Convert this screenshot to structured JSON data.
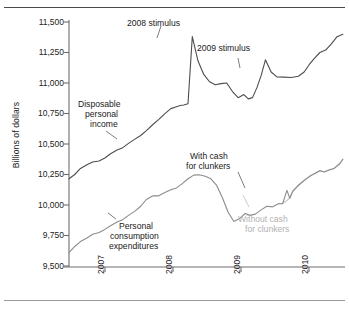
{
  "figure": {
    "name": "disposable-income-vs-consumption-chart",
    "background": "#ffffff"
  },
  "axes": {
    "ylabel": "Billions of dollars",
    "yticks": [
      "11,500",
      "11,250",
      "11,000",
      "10,750",
      "10,500",
      "10,250",
      "10,000",
      "9,750",
      "9,500"
    ],
    "xticks": [
      "2007",
      "2008",
      "2009",
      "2010"
    ]
  },
  "annotations": {
    "stimulus_2008": "2008 stimulus",
    "stimulus_2009": "2009 stimulus",
    "disposable_income_l1": "Disposable",
    "disposable_income_l2": "personal",
    "disposable_income_l3": "income",
    "pce_l1": "Personal",
    "pce_l2": "consumption",
    "pce_l3": "expenditures",
    "with_clunkers_l1": "With cash",
    "with_clunkers_l2": "for clunkers",
    "without_clunkers_l1": "Without cash",
    "without_clunkers_l2": "for clunkers"
  },
  "colors": {
    "income_line": "#4d4d4d",
    "pce_line": "#8c8c8c",
    "without_clunkers_line": "#c4c4c4",
    "axis": "#6e6e6e",
    "text": "#232323",
    "gray_text": "#b2b2b2"
  },
  "chart_data": {
    "type": "line",
    "title": "",
    "xlabel": "",
    "ylabel": "Billions of dollars",
    "ylim": [
      9500,
      11500
    ],
    "xlim": [
      2006.5,
      2010.35
    ],
    "grid": false,
    "legend": "annotations-inline",
    "yticks": [
      9500,
      9750,
      10000,
      10250,
      10500,
      10750,
      11000,
      11250,
      11500
    ],
    "xticks": [
      2007,
      2008,
      2009,
      2010
    ],
    "series": [
      {
        "name": "Disposable personal income",
        "color": "#4d4d4d",
        "points": [
          [
            2006.5,
            10215
          ],
          [
            2006.58,
            10250
          ],
          [
            2006.66,
            10300
          ],
          [
            2006.75,
            10330
          ],
          [
            2006.83,
            10352
          ],
          [
            2006.92,
            10360
          ],
          [
            2007.0,
            10385
          ],
          [
            2007.08,
            10420
          ],
          [
            2007.17,
            10450
          ],
          [
            2007.25,
            10470
          ],
          [
            2007.33,
            10505
          ],
          [
            2007.42,
            10540
          ],
          [
            2007.5,
            10570
          ],
          [
            2007.58,
            10610
          ],
          [
            2007.67,
            10660
          ],
          [
            2007.75,
            10700
          ],
          [
            2007.83,
            10745
          ],
          [
            2007.92,
            10790
          ],
          [
            2008.0,
            10805
          ],
          [
            2008.05,
            10815
          ],
          [
            2008.1,
            10820
          ],
          [
            2008.16,
            10830
          ],
          [
            2008.22,
            11380
          ],
          [
            2008.3,
            11180
          ],
          [
            2008.38,
            11070
          ],
          [
            2008.46,
            11010
          ],
          [
            2008.54,
            10985
          ],
          [
            2008.62,
            10995
          ],
          [
            2008.7,
            11000
          ],
          [
            2008.78,
            10930
          ],
          [
            2008.86,
            10880
          ],
          [
            2008.94,
            10905
          ],
          [
            2009.0,
            10870
          ],
          [
            2009.06,
            10880
          ],
          [
            2009.12,
            10960
          ],
          [
            2009.18,
            11060
          ],
          [
            2009.24,
            11190
          ],
          [
            2009.32,
            11090
          ],
          [
            2009.4,
            11050
          ],
          [
            2009.5,
            11048
          ],
          [
            2009.6,
            11045
          ],
          [
            2009.7,
            11055
          ],
          [
            2009.78,
            11090
          ],
          [
            2009.85,
            11150
          ],
          [
            2009.92,
            11200
          ],
          [
            2010.0,
            11250
          ],
          [
            2010.08,
            11270
          ],
          [
            2010.16,
            11320
          ],
          [
            2010.24,
            11380
          ],
          [
            2010.32,
            11400
          ]
        ]
      },
      {
        "name": "Personal consumption expenditures (with cash for clunkers)",
        "color": "#8c8c8c",
        "points": [
          [
            2006.5,
            9610
          ],
          [
            2006.58,
            9660
          ],
          [
            2006.66,
            9700
          ],
          [
            2006.75,
            9730
          ],
          [
            2006.83,
            9760
          ],
          [
            2006.92,
            9775
          ],
          [
            2007.0,
            9800
          ],
          [
            2007.08,
            9830
          ],
          [
            2007.17,
            9860
          ],
          [
            2007.25,
            9880
          ],
          [
            2007.33,
            9915
          ],
          [
            2007.42,
            9950
          ],
          [
            2007.5,
            9990
          ],
          [
            2007.58,
            10045
          ],
          [
            2007.67,
            10075
          ],
          [
            2007.75,
            10075
          ],
          [
            2007.83,
            10100
          ],
          [
            2007.92,
            10125
          ],
          [
            2008.0,
            10140
          ],
          [
            2008.08,
            10175
          ],
          [
            2008.16,
            10215
          ],
          [
            2008.24,
            10245
          ],
          [
            2008.32,
            10248
          ],
          [
            2008.4,
            10235
          ],
          [
            2008.48,
            10215
          ],
          [
            2008.56,
            10160
          ],
          [
            2008.64,
            10060
          ],
          [
            2008.72,
            9940
          ],
          [
            2008.8,
            9865
          ],
          [
            2008.88,
            9890
          ],
          [
            2008.96,
            9930
          ],
          [
            2009.02,
            9915
          ],
          [
            2009.1,
            9925
          ],
          [
            2009.18,
            9960
          ],
          [
            2009.26,
            9990
          ],
          [
            2009.34,
            9985
          ],
          [
            2009.42,
            10010
          ],
          [
            2009.48,
            10010
          ],
          [
            2009.54,
            10120
          ],
          [
            2009.58,
            10055
          ],
          [
            2009.62,
            10110
          ],
          [
            2009.7,
            10160
          ],
          [
            2009.78,
            10200
          ],
          [
            2009.86,
            10235
          ],
          [
            2009.92,
            10255
          ],
          [
            2010.0,
            10280
          ],
          [
            2010.06,
            10270
          ],
          [
            2010.12,
            10285
          ],
          [
            2010.2,
            10300
          ],
          [
            2010.28,
            10340
          ],
          [
            2010.32,
            10375
          ]
        ]
      },
      {
        "name": "Without cash for clunkers",
        "color": "#c4c4c4",
        "points": [
          [
            2009.42,
            10010
          ],
          [
            2009.48,
            10015
          ],
          [
            2009.54,
            10035
          ],
          [
            2009.58,
            10060
          ],
          [
            2009.62,
            10115
          ],
          [
            2009.7,
            10165
          ],
          [
            2009.78,
            10205
          ],
          [
            2009.86,
            10238
          ],
          [
            2009.92,
            10258
          ],
          [
            2010.0,
            10282
          ],
          [
            2010.06,
            10272
          ],
          [
            2010.12,
            10287
          ],
          [
            2010.2,
            10302
          ],
          [
            2010.28,
            10342
          ],
          [
            2010.32,
            10376
          ]
        ]
      }
    ],
    "annotations": [
      {
        "text": "2008 stimulus",
        "x": 2008.22,
        "y": 11380,
        "role": "spike-callout"
      },
      {
        "text": "2009 stimulus",
        "x": 2009.24,
        "y": 11190,
        "role": "spike-callout"
      },
      {
        "text": "Disposable personal income",
        "x": 2007.2,
        "y": 10700,
        "role": "series-label"
      },
      {
        "text": "Personal consumption expenditures",
        "x": 2007.85,
        "y": 9730,
        "role": "series-label"
      },
      {
        "text": "With cash for clunkers",
        "x": 2009.3,
        "y": 10250,
        "role": "series-label"
      },
      {
        "text": "Without cash for clunkers",
        "x": 2009.85,
        "y": 9830,
        "role": "series-label"
      }
    ]
  }
}
